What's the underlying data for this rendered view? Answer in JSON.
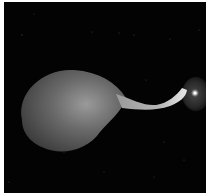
{
  "image": {
    "description": "Grayscale astronomical-style rendering: large diffuse lobe connected by a narrow twisted jet to a compact bright core with faint halo, on a black starfield",
    "background_color": "#030303",
    "border_color": "#ffffff",
    "elements": [
      {
        "name": "diffuse-lobe",
        "shade": "#6e6e6e"
      },
      {
        "name": "jet",
        "shade": "#bdbdbd"
      },
      {
        "name": "bright-core",
        "shade": "#ffffff"
      },
      {
        "name": "core-halo",
        "shade": "#3a3a3a"
      }
    ]
  }
}
